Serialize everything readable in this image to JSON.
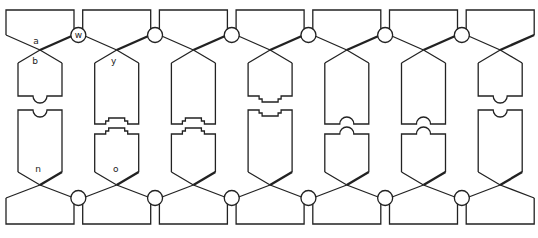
{
  "diagram": {
    "stroke_color": "#222222",
    "background_color": "#ffffff",
    "columns": [
      {
        "id": 1,
        "top_length": "short",
        "connector": "round",
        "top_label": "a",
        "upper_label": "b",
        "lower_label": "n"
      },
      {
        "id": 2,
        "top_length": "long",
        "connector": "square",
        "top_label": "",
        "upper_label": "y",
        "lower_label": "o"
      },
      {
        "id": 3,
        "top_length": "long",
        "connector": "square",
        "top_label": "",
        "upper_label": "",
        "lower_label": ""
      },
      {
        "id": 4,
        "top_length": "short",
        "connector": "square",
        "top_label": "",
        "upper_label": "",
        "lower_label": ""
      },
      {
        "id": 5,
        "top_length": "long",
        "connector": "round",
        "top_label": "",
        "upper_label": "",
        "lower_label": ""
      },
      {
        "id": 6,
        "top_length": "long",
        "connector": "round",
        "top_label": "",
        "upper_label": "",
        "lower_label": ""
      },
      {
        "id": 7,
        "top_length": "short",
        "connector": "round",
        "top_label": "",
        "upper_label": "",
        "lower_label": ""
      }
    ],
    "top_circles": [
      {
        "label": "w"
      },
      {
        "label": ""
      },
      {
        "label": ""
      },
      {
        "label": ""
      },
      {
        "label": ""
      },
      {
        "label": ""
      }
    ],
    "bottom_circles": [
      {
        "label": ""
      },
      {
        "label": ""
      },
      {
        "label": ""
      },
      {
        "label": ""
      },
      {
        "label": ""
      },
      {
        "label": ""
      }
    ]
  }
}
